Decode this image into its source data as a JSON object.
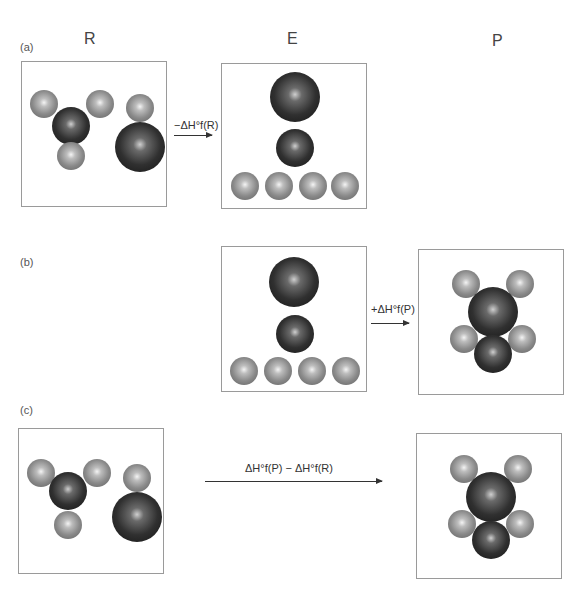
{
  "columns": {
    "reactants": "R",
    "elements": "E",
    "products": "P"
  },
  "parts": {
    "a": "(a)",
    "b": "(b)",
    "c": "(c)"
  },
  "arrows": {
    "a": "−ΔH°f(R)",
    "b": "+ΔH°f(P)",
    "c": "ΔH°f(P) − ΔH°f(R)"
  },
  "legend_atoms": {
    "small_atom": "light gray sphere",
    "large_atom": "dark sphere"
  }
}
